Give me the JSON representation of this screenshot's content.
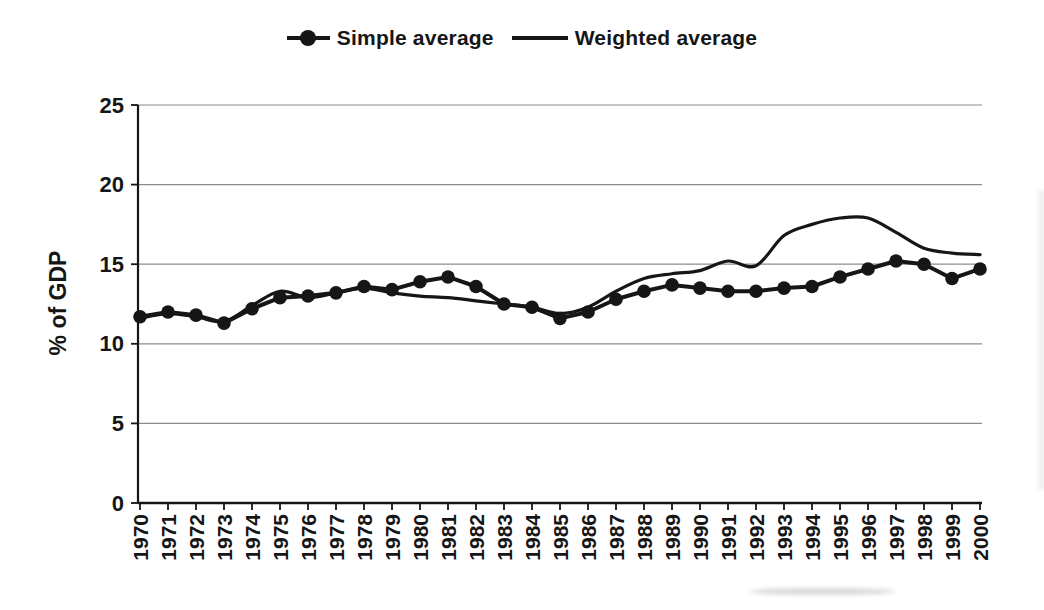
{
  "page": {
    "background": "#ffffff",
    "ink_color": "#161616",
    "grid_color": "#8c8c8c"
  },
  "legend": {
    "position": "top-center",
    "items": [
      {
        "label": "Simple average",
        "swatch": "line-with-filled-circle"
      },
      {
        "label": "Weighted average",
        "swatch": "plain-line"
      }
    ]
  },
  "chart_data": {
    "type": "line",
    "title": "",
    "xlabel": "",
    "ylabel": "% of GDP",
    "ylim": [
      0,
      25
    ],
    "yticks": [
      0,
      5,
      10,
      15,
      20,
      25
    ],
    "grid": "horizontal",
    "legend_position": "top-center",
    "x_tick_label_rotation": -90,
    "categories": [
      "1970",
      "1971",
      "1972",
      "1973",
      "1974",
      "1975",
      "1976",
      "1977",
      "1978",
      "1979",
      "1980",
      "1981",
      "1982",
      "1983",
      "1984",
      "1985",
      "1986",
      "1987",
      "1988",
      "1989",
      "1990",
      "1991",
      "1992",
      "1993",
      "1994",
      "1995",
      "1996",
      "1997",
      "1998",
      "1999",
      "2000"
    ],
    "series": [
      {
        "name": "Simple average",
        "marker": "filled-circle",
        "line_style": "straight",
        "color": "#161616",
        "values": [
          11.7,
          12.0,
          11.8,
          11.3,
          12.2,
          12.9,
          13.0,
          13.2,
          13.6,
          13.4,
          13.9,
          14.2,
          13.6,
          12.5,
          12.3,
          11.6,
          12.0,
          12.8,
          13.3,
          13.7,
          13.5,
          13.3,
          13.3,
          13.5,
          13.6,
          14.2,
          14.7,
          15.2,
          15.0,
          14.1,
          14.7
        ]
      },
      {
        "name": "Weighted average",
        "marker": "none",
        "line_style": "smooth",
        "color": "#161616",
        "values": [
          11.6,
          11.9,
          11.7,
          11.4,
          12.4,
          13.3,
          12.9,
          13.2,
          13.5,
          13.2,
          13.0,
          12.9,
          12.7,
          12.5,
          12.3,
          11.9,
          12.3,
          13.3,
          14.1,
          14.4,
          14.6,
          15.2,
          14.9,
          16.8,
          17.5,
          17.9,
          17.9,
          17.0,
          16.0,
          15.7,
          15.6
        ]
      }
    ]
  }
}
